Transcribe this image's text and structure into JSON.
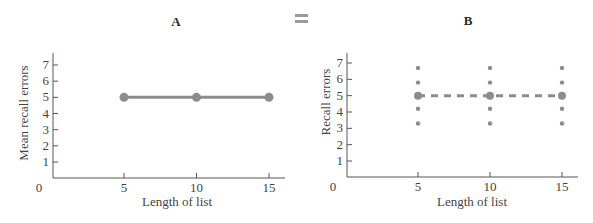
{
  "equals_symbol": "=",
  "colors": {
    "data": "#8c8c8c",
    "axis": "#555555",
    "text": "#444444"
  },
  "chart_data": [
    {
      "type": "line",
      "panel": "A",
      "title": "A",
      "xlabel": "Length of list",
      "ylabel": "Mean recall errors",
      "x_ticks": [
        0,
        5,
        10,
        15
      ],
      "y_ticks": [
        1,
        2,
        3,
        4,
        5,
        6,
        7
      ],
      "xlim": [
        0,
        16
      ],
      "ylim": [
        0,
        7.8
      ],
      "grid": false,
      "series": [
        {
          "name": "Mean recall errors",
          "x": [
            5,
            10,
            15
          ],
          "y": [
            5,
            5,
            5
          ],
          "style": "solid"
        }
      ]
    },
    {
      "type": "scatter",
      "panel": "B",
      "title": "B",
      "xlabel": "Length of list",
      "ylabel": "Recall errors",
      "x_ticks": [
        0,
        5,
        10,
        15
      ],
      "y_ticks": [
        1,
        2,
        3,
        4,
        5,
        6,
        7
      ],
      "xlim": [
        0,
        16
      ],
      "ylim": [
        0,
        7.8
      ],
      "grid": false,
      "series": [
        {
          "name": "Individual recall errors",
          "x": [
            5,
            5,
            5,
            5,
            10,
            10,
            10,
            10,
            15,
            15,
            15,
            15
          ],
          "y": [
            6.7,
            5.8,
            4.2,
            3.3,
            6.7,
            5.8,
            4.2,
            3.3,
            6.7,
            5.8,
            4.2,
            3.3
          ]
        },
        {
          "name": "Mean (dashed)",
          "x": [
            5,
            10,
            15
          ],
          "y": [
            5,
            5,
            5
          ],
          "style": "dashed"
        }
      ]
    }
  ]
}
